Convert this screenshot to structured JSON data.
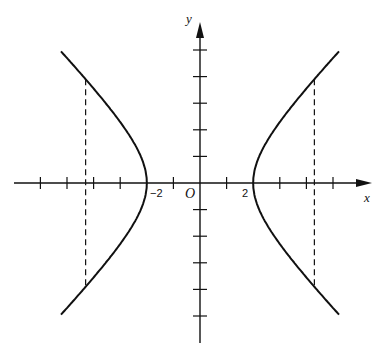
{
  "diagram": {
    "type": "hyperbola",
    "equation_implied": "x^2/4 - y^2/b^2 = 1",
    "labels": {
      "x_axis": "x",
      "y_axis": "y",
      "origin": "O",
      "left_vertex": "−2",
      "right_vertex": "2"
    },
    "axes": {
      "origin_px": [
        200,
        183
      ],
      "unit_px": 26.6,
      "x_ticks": [
        -6,
        -5,
        -4,
        -3,
        -1,
        1,
        3,
        4,
        5
      ],
      "y_ticks": [
        -5,
        -4,
        -3,
        -2,
        -1,
        1,
        2,
        3,
        4,
        5
      ]
    },
    "vertices": [
      [
        -2,
        0
      ],
      [
        2,
        0
      ]
    ],
    "dashed_verticals_x": [
      -4.3,
      4.3
    ],
    "colors": {
      "ink": "#111111",
      "background": "#ffffff"
    }
  }
}
